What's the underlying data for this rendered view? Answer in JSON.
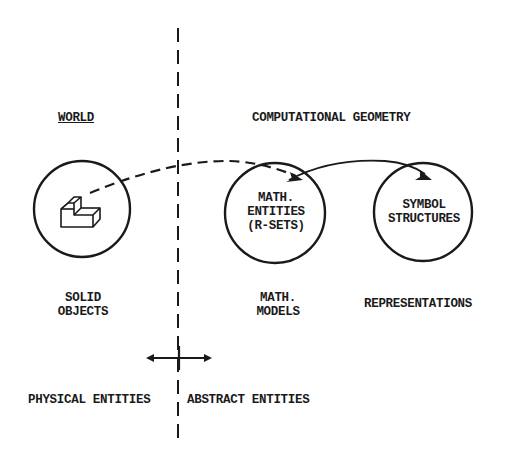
{
  "diagram": {
    "title_left": "WORLD",
    "title_right": "COMPUTATIONAL GEOMETRY",
    "nodes": [
      {
        "id": "solid",
        "inner_label": "",
        "icon": "l-block-solid-icon",
        "caption": "SOLID\nOBJECTS"
      },
      {
        "id": "math",
        "inner_label": "MATH.\nENTITIES\n(R-SETS)",
        "caption": "MATH.\nMODELS"
      },
      {
        "id": "symbol",
        "inner_label": "SYMBOL\nSTRUCTURES",
        "caption": "REPRESENTATIONS"
      }
    ],
    "edges": [
      {
        "from": "solid",
        "to": "math",
        "style": "dashed"
      },
      {
        "from": "math",
        "to": "symbol",
        "style": "solid"
      }
    ],
    "divider_label_left": "PHYSICAL ENTITIES",
    "divider_label_right": "ABSTRACT ENTITIES",
    "colors": {
      "ink": "#1a1a1a",
      "background": "#ffffff"
    }
  }
}
